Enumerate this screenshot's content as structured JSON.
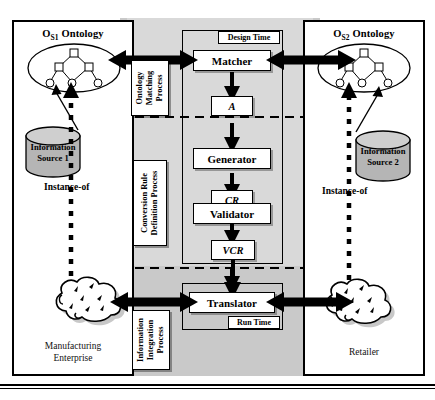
{
  "diagram": {
    "title_hidden": "Ontology-based information integration architecture",
    "left_panel": {
      "ontology_title": "O",
      "ontology_title_sub": "S1",
      "ontology_title_rest": " Ontology",
      "source_line1": "Information",
      "source_line2": "Source 1",
      "instance_label": "Instance-of",
      "footer_line1": "Manufacturing",
      "footer_line2": "Enterprise"
    },
    "right_panel": {
      "ontology_title": "O",
      "ontology_title_sub": "S2",
      "ontology_title_rest": " Ontology",
      "source_line1": "Information",
      "source_line2": "Source 2",
      "instance_label": "Instance-of",
      "footer_line1": "Retailer",
      "footer_line2": ""
    },
    "center": {
      "design_time_tag": "Design Time",
      "run_time_tag": "Run Time",
      "stages": [
        {
          "id": "matcher",
          "label": "Matcher"
        },
        {
          "id": "generator",
          "label": "Generator"
        },
        {
          "id": "validator",
          "label": "Validator"
        },
        {
          "id": "translator",
          "label": "Translator"
        }
      ],
      "artifacts": [
        {
          "id": "a",
          "label": "A"
        },
        {
          "id": "cr",
          "label": "CR"
        },
        {
          "id": "vcr",
          "label": "VCR"
        }
      ]
    },
    "process_labels": [
      {
        "id": "ontology-matching",
        "line1": "Ontology",
        "line2": "Matching",
        "line3": "Process"
      },
      {
        "id": "conversion-rule",
        "line1": "Conversion Rule",
        "line2": "Definition Process",
        "line3": ""
      },
      {
        "id": "information-integration",
        "line1": "Information",
        "line2": "Integration",
        "line3": "Process"
      }
    ],
    "colors": {
      "panel_gray": "#c9c9c9",
      "inner_gray": "#d9d9d9",
      "line": "#000000",
      "cylinder_fill": "#b5b5b5",
      "page_bg": "#ffffff"
    }
  }
}
